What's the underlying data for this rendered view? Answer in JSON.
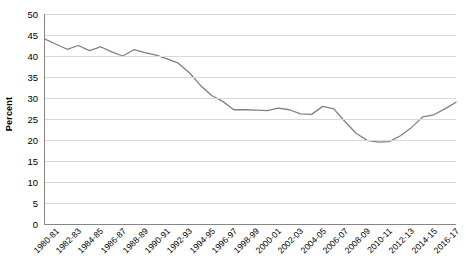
{
  "chart_data": {
    "type": "line",
    "title": "",
    "xlabel": "",
    "ylabel": "Percent",
    "ylim": [
      0,
      50
    ],
    "ytick_step": 5,
    "ytick_labels": [
      "50",
      "45",
      "40",
      "35",
      "30",
      "25",
      "20",
      "15",
      "10",
      "5",
      "0"
    ],
    "grid": true,
    "legend": "none",
    "line_color": "#808080",
    "x": [
      "1980-81",
      "1981-82",
      "1982-83",
      "1983-84",
      "1984-85",
      "1985-86",
      "1986-87",
      "1987-88",
      "1988-89",
      "1989-90",
      "1990-91",
      "1991-92",
      "1992-93",
      "1993-94",
      "1994-95",
      "1995-96",
      "1996-97",
      "1997-98",
      "1998-99",
      "1999-2000",
      "2000-01",
      "2001-02",
      "2002-03",
      "2003-04",
      "2004-05",
      "2005-06",
      "2006-07",
      "2007-08",
      "2008-09",
      "2009-10",
      "2010-11",
      "2011-12",
      "2012-13",
      "2013-14",
      "2014-15",
      "2015-16",
      "2016-17",
      "2017-18"
    ],
    "xtick_labels": [
      "1980-81",
      "1982-83",
      "1984-85",
      "1986-87",
      "1988-89",
      "1990-91",
      "1992-93",
      "1994-95",
      "1996-97",
      "1998-99",
      "2000-01",
      "2002-03",
      "2004-05",
      "2006-07",
      "2008-09",
      "2010-11",
      "2012-13",
      "2014-15",
      "2016-17"
    ],
    "values": [
      44.0,
      42.8,
      41.6,
      42.5,
      41.3,
      42.2,
      41.0,
      40.0,
      41.5,
      40.8,
      40.2,
      39.3,
      38.3,
      36.0,
      33.0,
      30.6,
      29.2,
      27.2,
      27.2,
      27.1,
      27.0,
      27.6,
      27.2,
      26.2,
      26.1,
      28.0,
      27.4,
      24.4,
      21.6,
      19.9,
      19.5,
      19.6,
      21.0,
      23.0,
      25.5,
      26.0,
      27.4,
      29.0
    ]
  }
}
